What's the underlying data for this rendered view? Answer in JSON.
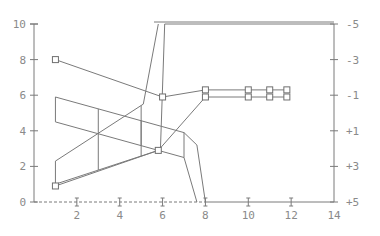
{
  "chart_data": {
    "type": "line",
    "title": "",
    "xlabel": "",
    "ylabel": "",
    "y2label": "",
    "xlim": [
      0,
      14
    ],
    "ylim": [
      0,
      10
    ],
    "y2lim": [
      -5,
      5
    ],
    "y2_inverted": true,
    "grid": false,
    "legend": "none",
    "x_ticks": [
      "2",
      "4",
      "6",
      "8",
      "10",
      "12",
      "14"
    ],
    "y_ticks": [
      "0",
      "2",
      "4",
      "6",
      "8",
      "10"
    ],
    "y2_ticks": [
      "-5",
      "-3",
      "-1",
      "+1",
      "+3",
      "+5"
    ],
    "series": [
      {
        "name": "upper-marked",
        "marker": "square",
        "x": [
          1,
          6,
          8,
          10,
          11,
          11.8
        ],
        "y": [
          8,
          5.9,
          6.3,
          6.3,
          6.3,
          6.3
        ]
      },
      {
        "name": "lower-marked",
        "marker": "square",
        "x": [
          1,
          5.8,
          8,
          10,
          11,
          11.8
        ],
        "y": [
          0.9,
          2.9,
          5.9,
          5.9,
          5.9,
          5.9
        ]
      },
      {
        "name": "rising-band-low",
        "marker": "none",
        "x": [
          1,
          5.8
        ],
        "y": [
          1,
          2.9
        ]
      },
      {
        "name": "rising-band-high",
        "marker": "none",
        "x": [
          1,
          5.1,
          5.8
        ],
        "y": [
          2.3,
          5.5,
          10
        ]
      },
      {
        "name": "steep-line-a",
        "marker": "none",
        "x": [
          5.9,
          6.1,
          7
        ],
        "y": [
          2.9,
          10,
          10
        ]
      },
      {
        "name": "top-plateau",
        "marker": "none",
        "x": [
          7,
          14
        ],
        "y": [
          10,
          10
        ]
      },
      {
        "name": "falling-band-top",
        "marker": "none",
        "x": [
          1,
          7,
          7.6,
          8
        ],
        "y": [
          5.9,
          3.9,
          3.2,
          0
        ]
      },
      {
        "name": "falling-band-bottom",
        "marker": "none",
        "x": [
          1,
          7,
          7.6
        ],
        "y": [
          4.5,
          2.5,
          0
        ]
      }
    ]
  }
}
